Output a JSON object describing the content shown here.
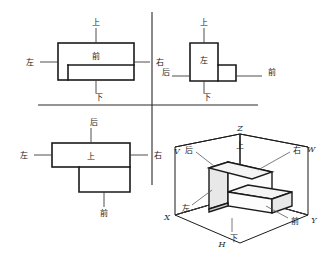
{
  "figure": {
    "colors": {
      "line": "#1a1a1a",
      "thin_line": "#5a5a5a",
      "background": "#ffffff",
      "face_top": "#f2f2f2",
      "face_front": "#ffffff",
      "face_side": "#d8d8d8"
    }
  },
  "labels": {
    "shang": "上",
    "xia": "下",
    "zuo": "左",
    "you": "右",
    "qian": "前",
    "hou": "后",
    "V": "V",
    "W": "W",
    "H": "H",
    "X": "X",
    "Y": "Y",
    "Z": "Z"
  },
  "views": {
    "front_view": {
      "name": "主视图",
      "quadrant": "top-left",
      "center_label": "前",
      "direction_labels": [
        {
          "text": "上",
          "position": "top"
        },
        {
          "text": "下",
          "position": "bottom"
        },
        {
          "text": "左",
          "position": "left"
        },
        {
          "text": "右",
          "position": "right"
        }
      ]
    },
    "side_view": {
      "name": "左视图",
      "quadrant": "top-right",
      "center_label": "左",
      "direction_labels": [
        {
          "text": "上",
          "position": "top"
        },
        {
          "text": "下",
          "position": "bottom"
        },
        {
          "text": "后",
          "position": "left"
        },
        {
          "text": "前",
          "position": "right"
        }
      ]
    },
    "top_view": {
      "name": "俯视图",
      "quadrant": "bottom-left",
      "center_label": "上",
      "direction_labels": [
        {
          "text": "后",
          "position": "top"
        },
        {
          "text": "前",
          "position": "bottom"
        },
        {
          "text": "左",
          "position": "left"
        },
        {
          "text": "右",
          "position": "right"
        }
      ]
    },
    "isometric_view": {
      "name": "轴测图",
      "quadrant": "bottom-right",
      "projection_planes": [
        {
          "text": "V",
          "meaning": "正立投影面"
        },
        {
          "text": "W",
          "meaning": "侧立投影面"
        },
        {
          "text": "H",
          "meaning": "水平投影面"
        }
      ],
      "axes": [
        {
          "text": "X"
        },
        {
          "text": "Y"
        },
        {
          "text": "Z"
        }
      ],
      "direction_labels": [
        {
          "text": "上"
        },
        {
          "text": "下"
        },
        {
          "text": "左"
        },
        {
          "text": "右"
        },
        {
          "text": "前"
        },
        {
          "text": "后"
        }
      ]
    }
  }
}
